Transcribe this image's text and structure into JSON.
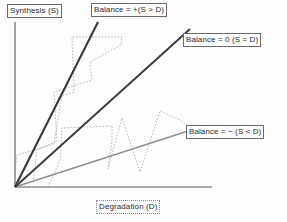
{
  "figure": {
    "background_color": "#fdfdfd"
  },
  "axes": {
    "y_label": "Synthesis (S)",
    "x_label": "Degradation (D)",
    "axis_color": "#8c8c8c",
    "origin": [
      15,
      187
    ],
    "x_end": [
      212,
      187
    ],
    "y_end": [
      15,
      22
    ]
  },
  "labels": {
    "balance_positive": "Balance = +(S > D)",
    "balance_zero": "Balance = 0 (S = D)",
    "balance_negative": "Balance = − (S < D)"
  },
  "chart_data": {
    "type": "line",
    "xlabel": "Degradation (D)",
    "ylabel": "Synthesis (S)",
    "xlim": [
      0,
      200
    ],
    "ylim": [
      0,
      166
    ],
    "grid": false,
    "legend": "inline-boxed-callouts",
    "series": [
      {
        "name": "Balance = +(S > D)",
        "style": "solid",
        "color": "#3a3a3a",
        "width": 2.0,
        "slope": 1.99,
        "points": [
          [
            15,
            187
          ],
          [
            98,
            22
          ]
        ]
      },
      {
        "name": "Balance = 0 (S = D)",
        "style": "solid",
        "color": "#3f3f3f",
        "width": 2.0,
        "slope": 0.9,
        "points": [
          [
            15,
            187
          ],
          [
            190,
            29
          ]
        ]
      },
      {
        "name": "Balance = − (S < D)",
        "style": "solid",
        "color": "#8a8a8a",
        "width": 1.3,
        "slope": 0.32,
        "points": [
          [
            15,
            187
          ],
          [
            188,
            131
          ]
        ]
      },
      {
        "name": "fluctuation-path-upper",
        "style": "dotted",
        "color": "#b3b3b3",
        "width": 1.0,
        "points": [
          [
            15,
            172
          ],
          [
            17,
            155
          ],
          [
            54,
            144
          ],
          [
            62,
            96
          ],
          [
            74,
            92
          ],
          [
            72,
            37
          ],
          [
            122,
            37
          ],
          [
            121,
            45
          ],
          [
            90,
            62
          ],
          [
            92,
            80
          ],
          [
            54,
            92
          ],
          [
            57,
            141
          ],
          [
            37,
            150
          ],
          [
            33,
            184
          ]
        ]
      },
      {
        "name": "fluctuation-path-lower",
        "style": "dotted",
        "color": "#b3b3b3",
        "width": 1.0,
        "points": [
          [
            48,
            187
          ],
          [
            60,
            160
          ],
          [
            62,
            128
          ],
          [
            112,
            126
          ],
          [
            112,
            141
          ],
          [
            108,
            169
          ],
          [
            122,
            118
          ],
          [
            140,
            172
          ],
          [
            160,
            111
          ],
          [
            180,
            120
          ],
          [
            188,
            126
          ]
        ]
      }
    ]
  }
}
